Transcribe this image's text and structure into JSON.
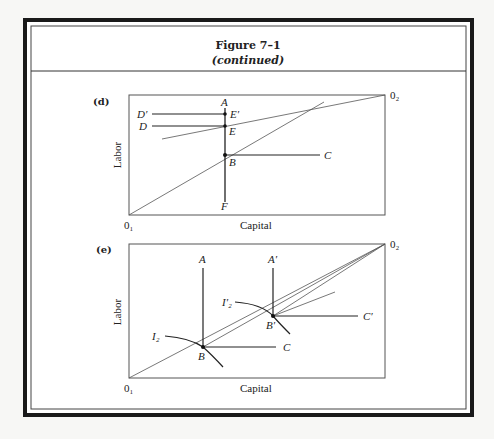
{
  "figure": {
    "title": "Figure 7–1",
    "subtitle": "(continued)"
  },
  "panel_d": {
    "label": "(d)",
    "ylabel": "Labor",
    "xlabel": "Capital",
    "origin_1": "0₁",
    "origin_2": "0₂",
    "points": {
      "A": "A",
      "E_prime": "E′",
      "E": "E",
      "B": "B",
      "C": "C",
      "D_prime": "D′",
      "D": "D",
      "F": "F"
    }
  },
  "panel_e": {
    "label": "(e)",
    "ylabel": "Labor",
    "xlabel": "Capital",
    "origin_1": "0₁",
    "origin_2": "0₂",
    "points": {
      "A": "A",
      "A_prime": "A′",
      "I2": "I₂",
      "I2_prime": "I′₂",
      "B": "B",
      "B_prime": "B′",
      "C": "C",
      "C_prime": "C′"
    }
  }
}
